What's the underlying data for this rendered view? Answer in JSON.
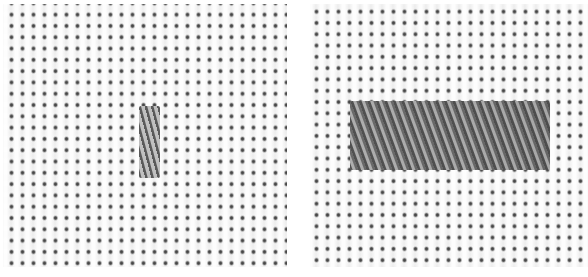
{
  "image": {
    "description": "Two photographs of needlepoint canvas (mono canvas grid) showing a stitch technique",
    "panels": [
      {
        "id": "left",
        "content": "single vertical upright twisted stitch over several canvas threads",
        "stitch_count": 1
      },
      {
        "id": "right",
        "content": "completed horizontal row of slanted/upright stitches forming a band",
        "stitch_count": 18
      }
    ],
    "colors": {
      "canvas": "#f3f3f3",
      "canvas_holes": "#3a3a3a",
      "thread": "#8d8d8d",
      "background": "#ffffff"
    },
    "grid": {
      "hole_pitch_x_px": 11,
      "hole_pitch_y_px": 11.3
    }
  }
}
